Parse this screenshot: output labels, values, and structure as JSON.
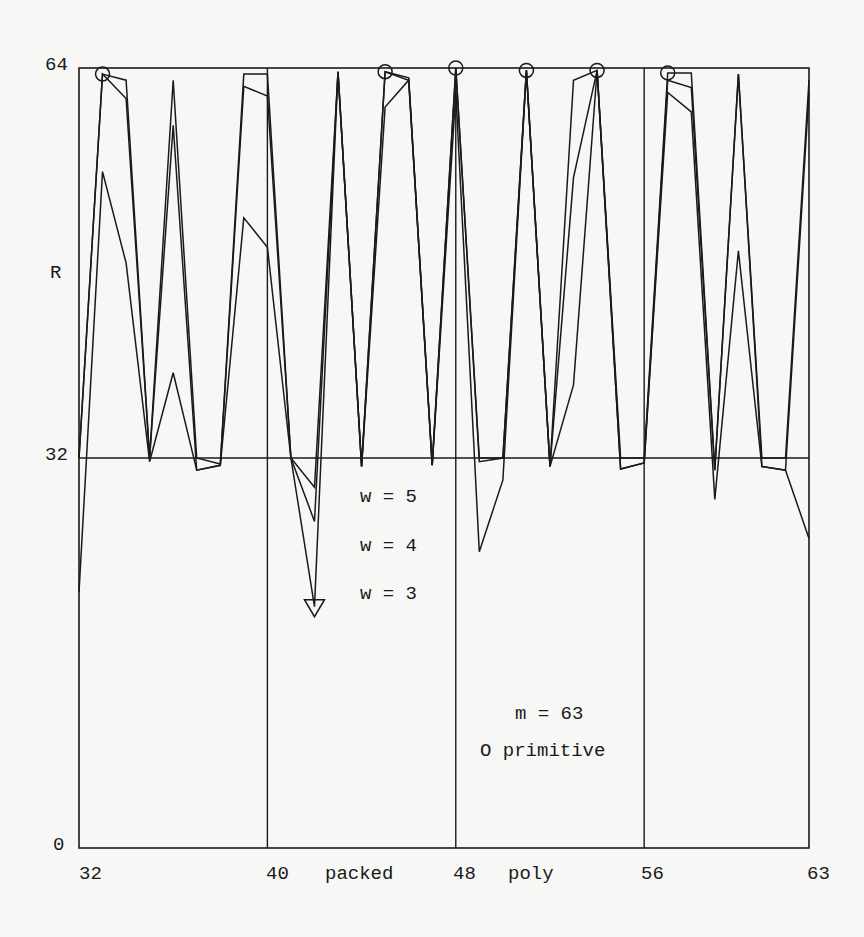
{
  "chart_data": {
    "type": "line",
    "title": "",
    "xlabel": "",
    "ylabel": "R",
    "x_axis_labels": [
      {
        "value": 32,
        "text": "32"
      },
      {
        "value": 40,
        "text": "40"
      },
      {
        "value": 44,
        "text": "packed"
      },
      {
        "value": 48,
        "text": "48"
      },
      {
        "value": 52,
        "text": "poly"
      },
      {
        "value": 56,
        "text": "56"
      },
      {
        "value": 63,
        "text": "63"
      }
    ],
    "y_tick_labels": [
      "0",
      "32",
      "64"
    ],
    "xlim": [
      32,
      63
    ],
    "ylim": [
      0,
      64
    ],
    "grid": {
      "vertical_at": [
        40,
        48,
        56
      ],
      "horizontal_at": [
        32
      ]
    },
    "x": [
      32,
      33,
      34,
      35,
      36,
      37,
      38,
      39,
      40,
      41,
      42,
      43,
      44,
      45,
      46,
      47,
      48,
      49,
      50,
      51,
      52,
      53,
      54,
      55,
      56,
      57,
      58,
      59,
      60,
      61,
      62,
      63
    ],
    "series": [
      {
        "name": "w = 5",
        "values": [
          32,
          63.5,
          63,
          32,
          63,
          32,
          31.5,
          63.5,
          63.5,
          32,
          29.6,
          63.7,
          31.3,
          63.7,
          63.2,
          31.4,
          64,
          32,
          32,
          63.8,
          31.3,
          63,
          63.8,
          32,
          32,
          63.6,
          63.6,
          31,
          63.5,
          32,
          32,
          63
        ]
      },
      {
        "name": "w = 4",
        "values": [
          32,
          63.5,
          61.5,
          32,
          59.3,
          31,
          31.4,
          62.5,
          61.7,
          32,
          26.8,
          63.7,
          31.3,
          63.7,
          63,
          31.4,
          64,
          31.7,
          32,
          63.8,
          31.3,
          55,
          63.8,
          31.1,
          31.6,
          63,
          62.4,
          31,
          63.5,
          31.3,
          31,
          62
        ]
      },
      {
        "name": "w = 3",
        "values": [
          21,
          55.5,
          48,
          31.7,
          39,
          31,
          31.4,
          51.7,
          49.3,
          32,
          19.8,
          63.7,
          31.3,
          60.8,
          63,
          31.4,
          62,
          24.3,
          30.2,
          63.8,
          31.3,
          38,
          63.8,
          31.1,
          31.6,
          62,
          60.4,
          28.6,
          49,
          31.3,
          31,
          25.4
        ]
      }
    ],
    "markers": {
      "primitive_circles": [
        {
          "x": 33,
          "y": 63.5
        },
        {
          "x": 45,
          "y": 63.7
        },
        {
          "x": 48,
          "y": 64
        },
        {
          "x": 51,
          "y": 63.8
        },
        {
          "x": 54,
          "y": 63.8
        },
        {
          "x": 57,
          "y": 63.6
        }
      ],
      "triangle": {
        "x": 42,
        "y": 19.8
      }
    },
    "legend": {
      "entries": [
        "w = 5",
        "w = 4",
        "w = 3"
      ],
      "position": "inside, center-left below R=32"
    },
    "annotations": [
      "m = 63",
      "O primitive"
    ]
  },
  "labels": {
    "y_axis_title": "R",
    "y_top": "64",
    "y_mid": "32",
    "y_bottom": "0",
    "x_32": "32",
    "x_40": "40",
    "x_packed": "packed",
    "x_48": "48",
    "x_poly": "poly",
    "x_56": "56",
    "x_63": "63",
    "legend_w5": "w = 5",
    "legend_w4": "w = 4",
    "legend_w3": "w = 3",
    "annotation_m": "m = 63",
    "annotation_primitive": "O primitive"
  },
  "colors": {
    "ink": "#1a1a1a",
    "paper": "#f7f7f5"
  }
}
